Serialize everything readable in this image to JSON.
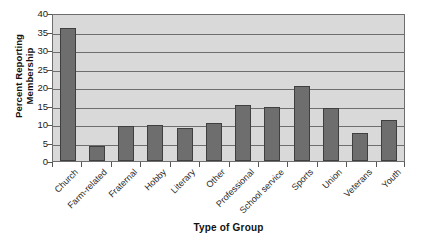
{
  "chart_data": {
    "type": "bar",
    "title": "",
    "xlabel": "Type of Group",
    "ylabel": "Percent Reporting Membership",
    "ylabel_lines": [
      "Percent Reporting",
      "Membership"
    ],
    "categories": [
      "Church",
      "Farm-related",
      "Fraternal",
      "Hobby",
      "Literary",
      "Other",
      "Professional",
      "School service",
      "Sports",
      "Union",
      "Veterans",
      "Youth"
    ],
    "values": [
      36,
      4,
      9.5,
      9.7,
      9,
      10.2,
      15.2,
      14.6,
      20.2,
      14.3,
      7.7,
      11.2
    ],
    "ylim": [
      0,
      40
    ],
    "yticks": [
      0,
      5,
      10,
      15,
      20,
      25,
      30,
      35,
      40
    ],
    "ytick_labels": [
      "0",
      "5",
      "10",
      "15",
      "20",
      "25",
      "30",
      "35",
      "40"
    ],
    "grid": true,
    "grid_axis": "y",
    "legend": "none",
    "colors": {
      "bar_fill": "#6e6e6e",
      "bar_border": "#3f3f3f",
      "plot_background": "#d9d9d9",
      "grid_line": "#6e6e6e",
      "axis_line": "#6e6e6e",
      "text": "#1a1a1a",
      "page_background": "#ffffff"
    }
  }
}
